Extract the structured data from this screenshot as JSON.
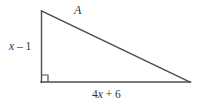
{
  "figure": {
    "type": "right-triangle-diagram",
    "background_color": "#ffffff",
    "line_color": "#4d4d4d",
    "text_color": "#333333",
    "labels": {
      "hypotenuse": "A",
      "vertical_leg": "x – 1",
      "vertical_leg_parts": {
        "variable": "x",
        "operator": " – ",
        "constant": "1"
      },
      "horizontal_leg": "4x + 6",
      "horizontal_leg_parts": {
        "coefficient": "4",
        "variable": "x",
        "operator": " + ",
        "constant": "6"
      }
    },
    "right_angle_marker": {
      "present": "true",
      "location": "bottom-left-vertex"
    },
    "vertices": {
      "apex": "41,11",
      "right_angle": "41,82",
      "right_end": "190,82"
    }
  }
}
